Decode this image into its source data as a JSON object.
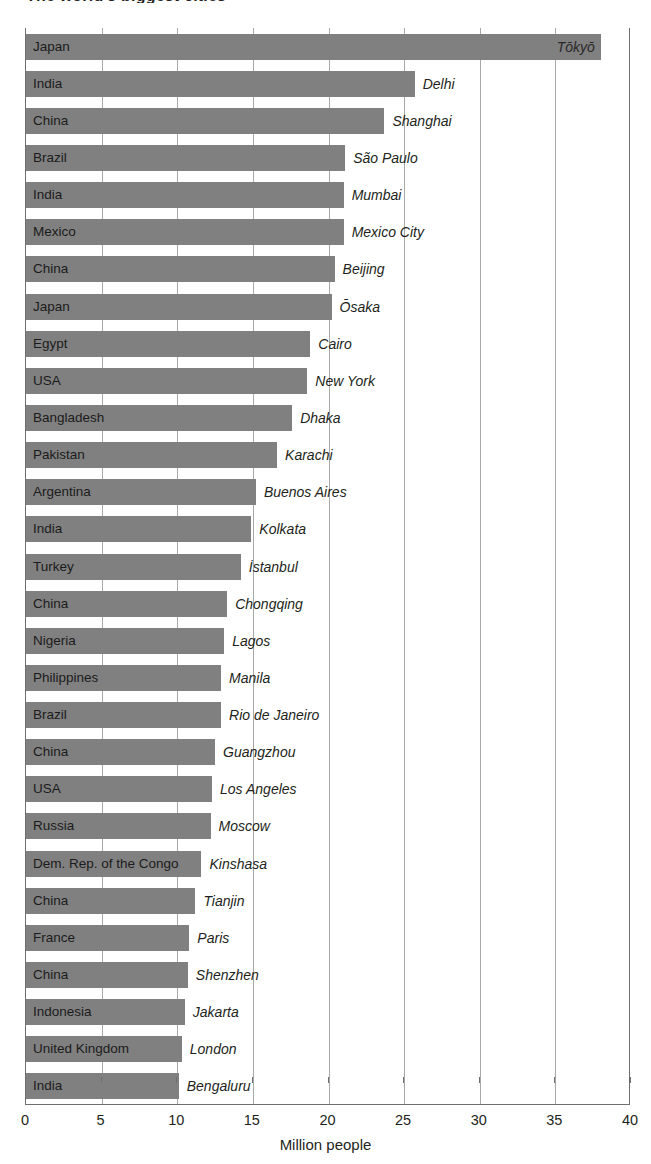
{
  "title_sliver": "The world's biggest cities",
  "axis": {
    "xlabel": "Million people",
    "ticks": [
      "0",
      "5",
      "10",
      "15",
      "20",
      "25",
      "30",
      "35",
      "40"
    ],
    "xmin": 0,
    "xmax": 40
  },
  "colors": {
    "bar": "#808080",
    "gridline": "#a8a8a8",
    "axis": "#6f6f6f",
    "text": "#231f20"
  },
  "chart_data": {
    "type": "bar",
    "orientation": "horizontal",
    "title": "The world's biggest cities",
    "xlabel": "Million people",
    "ylabel": "",
    "xlim": [
      0,
      40
    ],
    "xticks": [
      0,
      5,
      10,
      15,
      20,
      25,
      30,
      35,
      40
    ],
    "grid": true,
    "legend": false,
    "categories": [
      "Japan",
      "India",
      "China",
      "Brazil",
      "India",
      "Mexico",
      "China",
      "Japan",
      "Egypt",
      "USA",
      "Bangladesh",
      "Pakistan",
      "Argentina",
      "India",
      "Turkey",
      "China",
      "Nigeria",
      "Philippines",
      "Brazil",
      "China",
      "USA",
      "Russia",
      "Dem. Rep. of the Congo",
      "China",
      "France",
      "China",
      "Indonesia",
      "United Kingdom",
      "India"
    ],
    "cities": [
      "Tōkyō",
      "Delhi",
      "Shanghai",
      "São Paulo",
      "Mumbai",
      "Mexico City",
      "Beijing",
      "Ōsaka",
      "Cairo",
      "New York",
      "Dhaka",
      "Karachi",
      "Buenos Aires",
      "Kolkata",
      "İstanbul",
      "Chongqing",
      "Lagos",
      "Manila",
      "Rio de Janeiro",
      "Guangzhou",
      "Los Angeles",
      "Moscow",
      "Kinshasa",
      "Tianjin",
      "Paris",
      "Shenzhen",
      "Jakarta",
      "London",
      "Bengaluru"
    ],
    "values": [
      38.0,
      25.7,
      23.7,
      21.1,
      21.0,
      21.0,
      20.4,
      20.2,
      18.8,
      18.6,
      17.6,
      16.6,
      15.2,
      14.9,
      14.2,
      13.3,
      13.1,
      12.9,
      12.9,
      12.5,
      12.3,
      12.2,
      11.6,
      11.2,
      10.8,
      10.7,
      10.5,
      10.3,
      10.1
    ],
    "units": "million people",
    "data": [
      {
        "country": "Japan",
        "city": "Tōkyō",
        "value": 38.0
      },
      {
        "country": "India",
        "city": "Delhi",
        "value": 25.7
      },
      {
        "country": "China",
        "city": "Shanghai",
        "value": 23.7
      },
      {
        "country": "Brazil",
        "city": "São Paulo",
        "value": 21.1
      },
      {
        "country": "India",
        "city": "Mumbai",
        "value": 21.0
      },
      {
        "country": "Mexico",
        "city": "Mexico City",
        "value": 21.0
      },
      {
        "country": "China",
        "city": "Beijing",
        "value": 20.4
      },
      {
        "country": "Japan",
        "city": "Ōsaka",
        "value": 20.2
      },
      {
        "country": "Egypt",
        "city": "Cairo",
        "value": 18.8
      },
      {
        "country": "USA",
        "city": "New York",
        "value": 18.6
      },
      {
        "country": "Bangladesh",
        "city": "Dhaka",
        "value": 17.6
      },
      {
        "country": "Pakistan",
        "city": "Karachi",
        "value": 16.6
      },
      {
        "country": "Argentina",
        "city": "Buenos Aires",
        "value": 15.2
      },
      {
        "country": "India",
        "city": "Kolkata",
        "value": 14.9
      },
      {
        "country": "Turkey",
        "city": "İstanbul",
        "value": 14.2
      },
      {
        "country": "China",
        "city": "Chongqing",
        "value": 13.3
      },
      {
        "country": "Nigeria",
        "city": "Lagos",
        "value": 13.1
      },
      {
        "country": "Philippines",
        "city": "Manila",
        "value": 12.9
      },
      {
        "country": "Brazil",
        "city": "Rio de Janeiro",
        "value": 12.9
      },
      {
        "country": "China",
        "city": "Guangzhou",
        "value": 12.5
      },
      {
        "country": "USA",
        "city": "Los Angeles",
        "value": 12.3
      },
      {
        "country": "Russia",
        "city": "Moscow",
        "value": 12.2
      },
      {
        "country": "Dem. Rep. of the Congo",
        "city": "Kinshasa",
        "value": 11.6
      },
      {
        "country": "China",
        "city": "Tianjin",
        "value": 11.2
      },
      {
        "country": "France",
        "city": "Paris",
        "value": 10.8
      },
      {
        "country": "China",
        "city": "Shenzhen",
        "value": 10.7
      },
      {
        "country": "Indonesia",
        "city": "Jakarta",
        "value": 10.5
      },
      {
        "country": "United Kingdom",
        "city": "London",
        "value": 10.3
      },
      {
        "country": "India",
        "city": "Bengaluru",
        "value": 10.1
      }
    ]
  }
}
